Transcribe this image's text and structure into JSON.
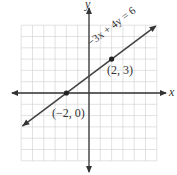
{
  "chart_data": {
    "type": "line",
    "title": "",
    "xlabel": "x",
    "ylabel": "y",
    "xlim": [
      -6,
      6
    ],
    "ylim": [
      -6,
      6
    ],
    "grid": true,
    "series": [
      {
        "name": "-3x + 4y = 6",
        "equation": "-3x + 4y = 6",
        "slope": 0.75,
        "intercept": 1.5
      }
    ],
    "points": [
      {
        "x": -2,
        "y": 0,
        "label": "(−2, 0)"
      },
      {
        "x": 2,
        "y": 3,
        "label": "(2, 3)"
      }
    ],
    "annotations": [
      "−3x + 4y = 6",
      "(2, 3)",
      "(−2, 0)"
    ]
  },
  "labels": {
    "x_axis": "x",
    "y_axis": "y",
    "equation": "−3x + 4y = 6",
    "point_a": "(2, 3)",
    "point_b": "(−2, 0)"
  }
}
